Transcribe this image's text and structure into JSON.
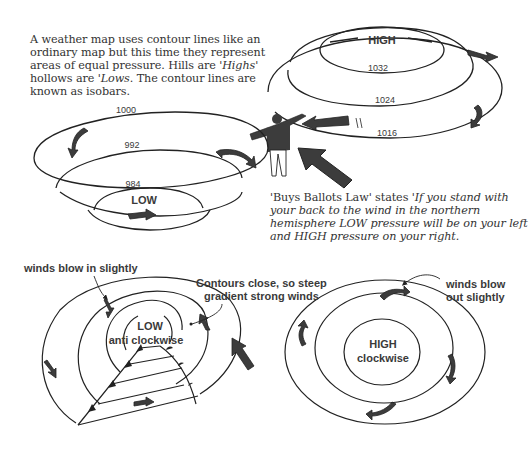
{
  "intro": {
    "text_part1": "A weather map uses contour lines like an ordinary map but this time they represent areas of equal pressure. Hills are ",
    "highs": "'Highs'",
    "text_part2": " hollows are ",
    "lows": "'Lows",
    "text_part3": ". The contour lines are known as isobars."
  },
  "law": {
    "lead": "'Buys Ballots Law' states ",
    "quote": "'If you stand with your back to the wind in the northern hemisphere LOW pressure will be on your left and HIGH pressure on your right."
  },
  "high_hill": {
    "title": "HIGH",
    "isobars": [
      "1032",
      "1024",
      "1016"
    ]
  },
  "low_bowl": {
    "title": "LOW",
    "isobars": [
      "1000",
      "992",
      "984"
    ]
  },
  "low_map": {
    "callout_in": "winds blow in slightly",
    "center_line1": "LOW",
    "center_line2": "anti clockwise"
  },
  "gradient_note": {
    "line1": "Contours close, so steep",
    "line2": "gradient strong winds"
  },
  "high_map": {
    "callout_out_line1": "winds blow",
    "callout_out_line2": "out slightly",
    "center_line1": "HIGH",
    "center_line2": "clockwise"
  },
  "colors": {
    "ink": "#222222",
    "arrow_fill": "#3c3c3c",
    "text": "#333333",
    "background": "#ffffff"
  }
}
